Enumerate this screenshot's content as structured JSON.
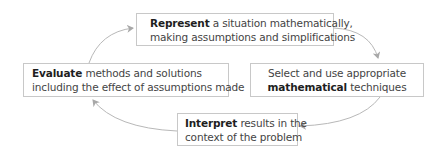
{
  "diagram": {
    "type": "cycle",
    "direction": "clockwise",
    "colors": {
      "box_border": "#c8c8c8",
      "arrow": "#b4b4b4",
      "text": "#444444",
      "bold_text": "#1e1e1e",
      "background": "#ffffff"
    },
    "nodes": [
      {
        "id": "represent",
        "line1_bold": "Represent",
        "line1_rest": " a situation mathematically,",
        "line2_bold": "",
        "line2_rest": "making assumptions and simplifications"
      },
      {
        "id": "select",
        "line1_bold": "",
        "line1_rest": "Select and use appropriate",
        "line2_bold": "mathematical",
        "line2_rest": " techniques"
      },
      {
        "id": "interpret",
        "line1_bold": "Interpret",
        "line1_rest": " results in the",
        "line2_bold": "",
        "line2_rest": "context of the problem"
      },
      {
        "id": "evaluate",
        "line1_bold": "Evaluate",
        "line1_rest": " methods and solutions",
        "line2_bold": "",
        "line2_rest": "including the effect of assumptions made"
      }
    ],
    "edges": [
      {
        "from": "represent",
        "to": "select"
      },
      {
        "from": "select",
        "to": "interpret"
      },
      {
        "from": "interpret",
        "to": "evaluate"
      },
      {
        "from": "evaluate",
        "to": "represent"
      }
    ]
  }
}
